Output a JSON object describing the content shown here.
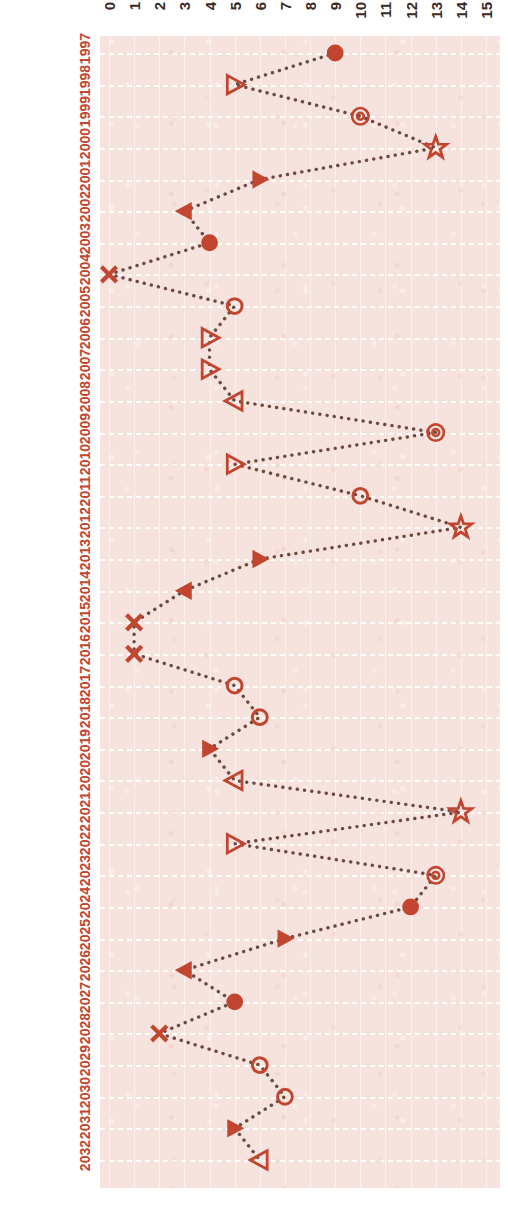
{
  "figure": {
    "style": "dotted-line-with-markers",
    "accent_color": "#c1452f",
    "panel_color": "#f7e3dd",
    "grid_color": "#ffffff",
    "axis_label_color_x": "#3a2a26",
    "axis_label_color_y": "#c1452f",
    "orientation": "rotated-90-ccw"
  },
  "chart_data": {
    "type": "line",
    "title": "",
    "xlabel": "",
    "ylabel": "",
    "xlim": [
      0,
      15
    ],
    "ylim_categories": "1997-2032",
    "grid": true,
    "legend": "none",
    "x_ticks": [
      "0",
      "1",
      "2",
      "3",
      "4",
      "5",
      "6",
      "7",
      "8",
      "9",
      "10",
      "11",
      "12",
      "13",
      "14",
      "15"
    ],
    "x_tick_values": [
      0,
      1,
      2,
      3,
      4,
      5,
      6,
      7,
      8,
      9,
      10,
      11,
      12,
      13,
      14,
      15
    ],
    "categories": [
      "1997",
      "1998",
      "1999",
      "2000",
      "2001",
      "2002",
      "2003",
      "2004",
      "2005",
      "2006",
      "2007",
      "2008",
      "2009",
      "2010",
      "2011",
      "2012",
      "2013",
      "2014",
      "2015",
      "2016",
      "2017",
      "2018",
      "2019",
      "2020",
      "2021",
      "2022",
      "2023",
      "2024",
      "2025",
      "2026",
      "2027",
      "2028",
      "2029",
      "2030",
      "2031",
      "2032"
    ],
    "values": [
      9,
      5,
      10,
      13,
      6,
      3,
      4,
      0,
      5,
      4,
      4,
      5,
      13,
      5,
      10,
      14,
      6,
      3,
      1,
      1,
      5,
      6,
      4,
      5,
      14,
      5,
      13,
      12,
      7,
      3,
      5,
      2,
      6,
      7,
      5,
      6
    ],
    "markers": [
      "filled-circle",
      "open-right-triangle",
      "target-circle",
      "open-star",
      "filled-right-triangle",
      "filled-left-triangle",
      "filled-circle",
      "x-cross",
      "open-circle",
      "open-right-triangle",
      "open-right-triangle",
      "open-left-triangle",
      "target-circle",
      "open-right-triangle",
      "open-circle",
      "open-star",
      "filled-right-triangle",
      "filled-left-triangle",
      "x-cross",
      "x-cross",
      "open-circle",
      "open-circle",
      "filled-right-triangle",
      "open-left-triangle",
      "open-star",
      "open-right-triangle",
      "target-circle",
      "filled-circle",
      "filled-right-triangle",
      "filled-left-triangle",
      "filled-circle",
      "x-cross",
      "open-circle",
      "open-circle",
      "filled-right-triangle",
      "open-left-triangle"
    ],
    "series": [
      {
        "name": "series-1",
        "values": [
          9,
          5,
          10,
          13,
          6,
          3,
          4,
          0,
          5,
          4,
          4,
          5,
          13,
          5,
          10,
          14,
          6,
          3,
          1,
          1,
          5,
          6,
          4,
          5,
          14,
          5,
          13,
          12,
          7,
          3,
          5,
          2,
          6,
          7,
          5,
          6
        ]
      }
    ]
  }
}
